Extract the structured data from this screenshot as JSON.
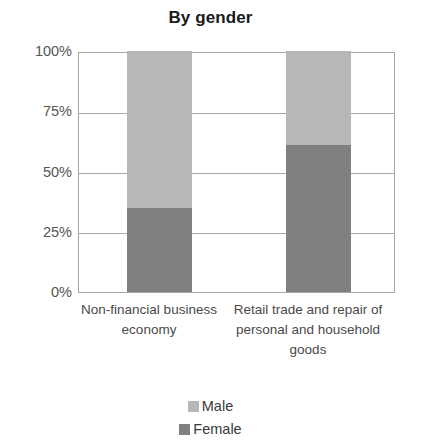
{
  "chart_data": {
    "type": "bar",
    "subtype": "stacked-percentage",
    "title": "By gender",
    "xlabel": "",
    "ylabel": "",
    "ylim": [
      0,
      100
    ],
    "yticks": [
      "0%",
      "25%",
      "50%",
      "75%",
      "100%"
    ],
    "ytick_values": [
      0,
      25,
      50,
      75,
      100
    ],
    "grid": true,
    "legend_position": "bottom",
    "categories": [
      "Non-financial business economy",
      "Retail trade and repair of personal and household goods"
    ],
    "series": [
      {
        "name": "Male",
        "color": "#b7b7b7",
        "values": [
          65,
          39
        ]
      },
      {
        "name": "Female",
        "color": "#808080",
        "values": [
          35,
          61
        ]
      }
    ]
  },
  "axis": {
    "ticks": [
      {
        "label": "100%",
        "value": 100
      },
      {
        "label": "75%",
        "value": 75
      },
      {
        "label": "50%",
        "value": 50
      },
      {
        "label": "25%",
        "value": 25
      },
      {
        "label": "0%",
        "value": 0
      }
    ]
  },
  "legend": {
    "items": [
      {
        "label": "Male",
        "color": "#b7b7b7"
      },
      {
        "label": "Female",
        "color": "#808080"
      }
    ]
  },
  "colors": {
    "male": "#b7b7b7",
    "female": "#808080",
    "grid": "#a8a8a8",
    "title": "#1a1a1a",
    "text": "#4a4a4a",
    "background": "#ffffff"
  }
}
